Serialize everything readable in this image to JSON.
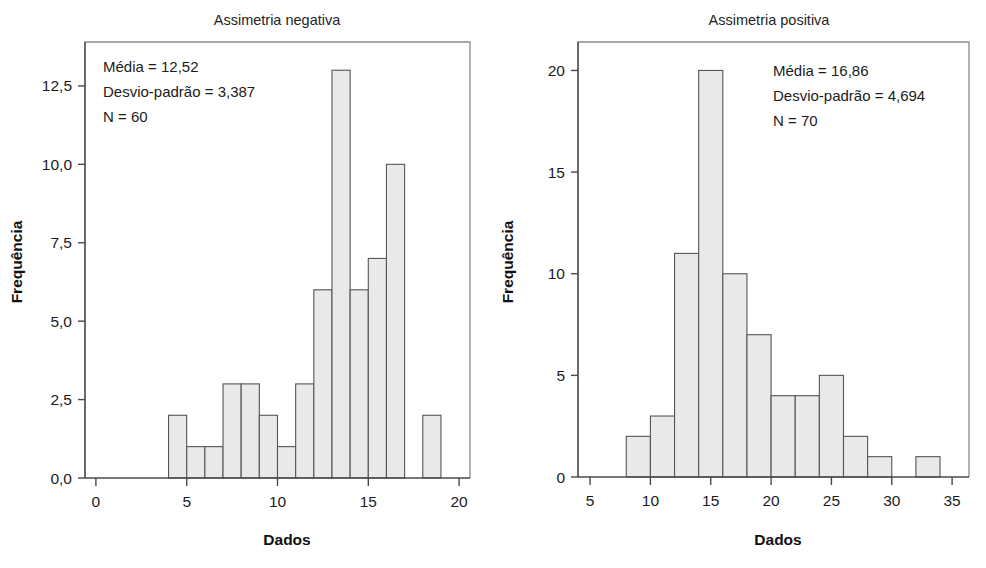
{
  "figure": {
    "axis_label_x": "Dados",
    "axis_label_y": "Frequência"
  },
  "charts": [
    {
      "id": "assimetria-negativa",
      "title": "Assimetria negativa",
      "annotation": {
        "mean": "Média = 12,52",
        "sd": "Desvio-padrão = 3,387",
        "n": "N = 60"
      },
      "bar_fill": "#e9e9e9",
      "bar_stroke": "#555555"
    },
    {
      "id": "assimetria-positiva",
      "title": "Assimetria positiva",
      "annotation": {
        "mean": "Média = 16,86",
        "sd": "Desvio-padrão = 4,694",
        "n": "N = 70"
      },
      "bar_fill": "#e9e9e9",
      "bar_stroke": "#555555"
    }
  ],
  "chart_data": [
    {
      "type": "bar",
      "id": "assimetria-negativa",
      "title": "Assimetria negativa",
      "xlabel": "Dados",
      "ylabel": "Frequência",
      "xlim": [
        -0.6,
        20.6
      ],
      "ylim": [
        0,
        13.9
      ],
      "grid": false,
      "legend": null,
      "xticks": [
        0,
        5,
        10,
        15,
        20
      ],
      "xticklabels": [
        "0",
        "5",
        "10",
        "15",
        "20"
      ],
      "yticks": [
        0,
        2.5,
        5,
        7.5,
        10,
        12.5
      ],
      "yticklabels": [
        "0,0",
        "2,5",
        "5,0",
        "7,5",
        "10,0",
        "12,5"
      ],
      "bin_width": 1,
      "bin_starts": [
        4,
        5,
        6,
        7,
        8,
        9,
        10,
        11,
        12,
        13,
        14,
        15,
        18
      ],
      "values": [
        2,
        1,
        1,
        3,
        3,
        2,
        1,
        3,
        6,
        13,
        6,
        7,
        10,
        2
      ],
      "bins": [
        {
          "start": 4,
          "end": 5,
          "count": 2
        },
        {
          "start": 5,
          "end": 6,
          "count": 1
        },
        {
          "start": 6,
          "end": 7,
          "count": 1
        },
        {
          "start": 7,
          "end": 8,
          "count": 3
        },
        {
          "start": 8,
          "end": 9,
          "count": 3
        },
        {
          "start": 9,
          "end": 10,
          "count": 2
        },
        {
          "start": 10,
          "end": 11,
          "count": 1
        },
        {
          "start": 11,
          "end": 12,
          "count": 3
        },
        {
          "start": 12,
          "end": 13,
          "count": 6
        },
        {
          "start": 13,
          "end": 14,
          "count": 13
        },
        {
          "start": 14,
          "end": 15,
          "count": 6
        },
        {
          "start": 15,
          "end": 16,
          "count": 7
        },
        {
          "start": 16,
          "end": 17,
          "count": 10
        },
        {
          "start": 18,
          "end": 19,
          "count": 2
        }
      ],
      "annotations": [
        "Média = 12,52",
        "Desvio-padrão = 3,387",
        "N = 60"
      ],
      "statistics": {
        "mean": 12.52,
        "sd": 3.387,
        "n": 60
      }
    },
    {
      "type": "bar",
      "id": "assimetria-positiva",
      "title": "Assimetria positiva",
      "xlabel": "Dados",
      "ylabel": "Frequência",
      "xlim": [
        4.0,
        36.4
      ],
      "ylim": [
        0,
        21.4
      ],
      "grid": false,
      "legend": null,
      "xticks": [
        5,
        10,
        15,
        20,
        25,
        30,
        35
      ],
      "xticklabels": [
        "5",
        "10",
        "15",
        "20",
        "25",
        "30",
        "35"
      ],
      "yticks": [
        0,
        5,
        10,
        15,
        20
      ],
      "yticklabels": [
        "0",
        "5",
        "10",
        "15",
        "20"
      ],
      "bin_width": 2,
      "bin_starts": [
        8,
        10,
        12,
        14,
        16,
        18,
        20,
        22,
        24,
        26,
        28,
        32
      ],
      "values": [
        2,
        3,
        11,
        20,
        10,
        7,
        4,
        4,
        5,
        2,
        1,
        1
      ],
      "bins": [
        {
          "start": 8,
          "end": 10,
          "count": 2
        },
        {
          "start": 10,
          "end": 12,
          "count": 3
        },
        {
          "start": 12,
          "end": 14,
          "count": 11
        },
        {
          "start": 14,
          "end": 16,
          "count": 20
        },
        {
          "start": 16,
          "end": 18,
          "count": 10
        },
        {
          "start": 18,
          "end": 20,
          "count": 7
        },
        {
          "start": 20,
          "end": 22,
          "count": 4
        },
        {
          "start": 22,
          "end": 24,
          "count": 4
        },
        {
          "start": 24,
          "end": 26,
          "count": 5
        },
        {
          "start": 26,
          "end": 28,
          "count": 2
        },
        {
          "start": 28,
          "end": 30,
          "count": 1
        },
        {
          "start": 32,
          "end": 34,
          "count": 1
        }
      ],
      "annotations": [
        "Média = 16,86",
        "Desvio-padrão = 4,694",
        "N = 70"
      ],
      "statistics": {
        "mean": 16.86,
        "sd": 4.694,
        "n": 70
      }
    }
  ]
}
